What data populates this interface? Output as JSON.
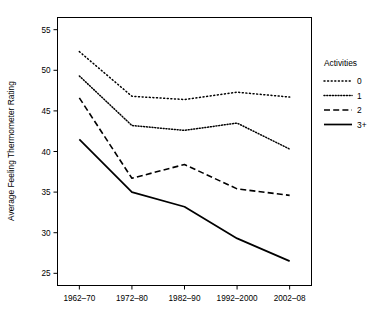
{
  "chart_data": {
    "type": "line",
    "title": "",
    "subtitle": "",
    "xlabel": "",
    "ylabel": "Average Feeling Thermometer Rating",
    "categories": [
      "1962–70",
      "1972–80",
      "1982–90",
      "1992–2000",
      "2002–08"
    ],
    "x_tick_labels": [
      "1962–70",
      "1972–80",
      "1982–90",
      "1992–2000",
      "2002–08"
    ],
    "y_tick_labels": [
      "25",
      "30",
      "35",
      "40",
      "45",
      "50",
      "55"
    ],
    "y_ticks": [
      25,
      30,
      35,
      40,
      45,
      50,
      55
    ],
    "ylim": [
      23.5,
      56.5
    ],
    "grid": false,
    "legend_position": "right",
    "legend_title": "Activities",
    "series": [
      {
        "name": "0",
        "style": "dotted",
        "color": "#000000",
        "values": [
          52.3,
          46.8,
          46.4,
          47.3,
          46.7
        ]
      },
      {
        "name": "1",
        "style": "dotted-dense",
        "color": "#000000",
        "values": [
          49.3,
          43.2,
          42.6,
          43.5,
          40.3
        ]
      },
      {
        "name": "2",
        "style": "dashed",
        "color": "#000000",
        "values": [
          46.6,
          36.7,
          38.4,
          35.4,
          34.6
        ]
      },
      {
        "name": "3+",
        "style": "solid",
        "color": "#000000",
        "values": [
          41.5,
          35.0,
          33.2,
          29.3,
          26.5
        ]
      }
    ]
  },
  "axes": {
    "y_title": "Average Feeling Thermometer Rating"
  },
  "legend": {
    "title": "Activities",
    "entries": [
      {
        "label": "0",
        "style": "dotted"
      },
      {
        "label": "1",
        "style": "dotted-dense"
      },
      {
        "label": "2",
        "style": "dashed"
      },
      {
        "label": "3+",
        "style": "solid"
      }
    ]
  },
  "colors": {
    "axis": "#000000",
    "line": "#000000",
    "background": "#ffffff"
  }
}
